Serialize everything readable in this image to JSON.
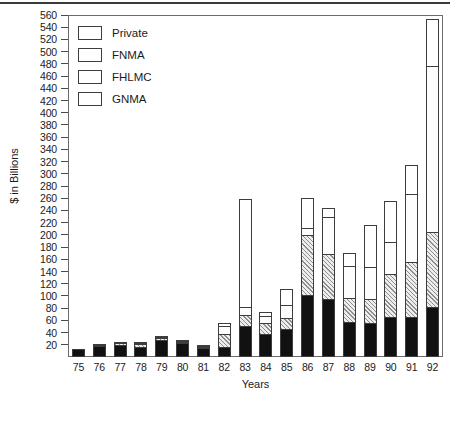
{
  "chart_data": {
    "type": "bar",
    "subtype": "stacked-bar",
    "title": "",
    "subtitle": "",
    "xlabel": "Years",
    "ylabel": "$ in Billions",
    "categories": [
      "75",
      "76",
      "77",
      "78",
      "79",
      "80",
      "81",
      "82",
      "83",
      "84",
      "85",
      "86",
      "87",
      "88",
      "89",
      "90",
      "91",
      "92"
    ],
    "ylim": [
      0,
      560
    ],
    "ytick_step": 20,
    "yticks": [
      0,
      20,
      40,
      60,
      80,
      100,
      120,
      140,
      160,
      180,
      200,
      220,
      240,
      260,
      280,
      300,
      320,
      340,
      360,
      380,
      400,
      420,
      440,
      460,
      480,
      500,
      520,
      540,
      560
    ],
    "grid": false,
    "legend_position": "top-left",
    "series": [
      {
        "name": "GNMA",
        "color": "#111111",
        "pattern": "solid-black",
        "values": [
          13,
          18,
          20,
          17,
          28,
          23,
          15,
          16,
          51,
          38,
          46,
          102,
          95,
          58,
          56,
          65,
          66,
          82
        ]
      },
      {
        "name": "FHLMC",
        "color": "#ededed",
        "pattern": "diagonal-hatch",
        "values": [
          0,
          2,
          4,
          6,
          5,
          3,
          2,
          24,
          20,
          19,
          20,
          100,
          75,
          40,
          40,
          73,
          92,
          125
        ]
      },
      {
        "name": "FNMA",
        "color": "#fdfdfd",
        "pattern": "fine-dots",
        "values": [
          0,
          0,
          0,
          1,
          3,
          2,
          1,
          14,
          14,
          13,
          22,
          13,
          63,
          55,
          55,
          54,
          112,
          272
        ]
      },
      {
        "name": "Private",
        "color": "#ffffff",
        "pattern": "open",
        "values": [
          0,
          1,
          2,
          3,
          3,
          2,
          2,
          6,
          178,
          8,
          28,
          51,
          16,
          23,
          70,
          68,
          50,
          80
        ]
      }
    ],
    "totals": [
      13,
      21,
      26,
      27,
      39,
      30,
      20,
      60,
      263,
      78,
      116,
      266,
      249,
      176,
      221,
      260,
      320,
      559
    ]
  },
  "legend": {
    "items": [
      {
        "label": "Private",
        "pattern": "open"
      },
      {
        "label": "FNMA",
        "pattern": "fine-dots"
      },
      {
        "label": "FHLMC",
        "pattern": "diagonal-hatch"
      },
      {
        "label": "GNMA",
        "pattern": "solid-black"
      }
    ]
  }
}
